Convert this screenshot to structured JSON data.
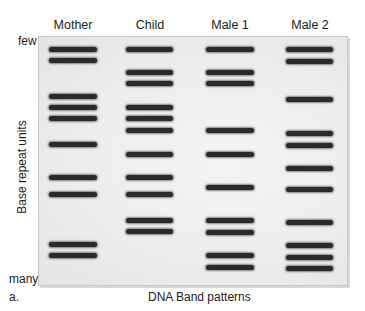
{
  "figure": {
    "panel_label": "a.",
    "x_axis_title": "DNA Band patterns",
    "y_axis_title": "Base repeat units",
    "y_axis_top": "few",
    "y_axis_bottom": "many"
  },
  "lanes": [
    {
      "label": "Mother",
      "x": 49,
      "width": 48,
      "bands_y": [
        49,
        60,
        96,
        107,
        118,
        144,
        177,
        194,
        244,
        255
      ]
    },
    {
      "label": "Child",
      "x": 126,
      "width": 47,
      "bands_y": [
        49,
        72,
        83,
        107,
        118,
        130,
        154,
        177,
        194,
        220,
        231
      ]
    },
    {
      "label": "Male 1",
      "x": 206,
      "width": 48,
      "bands_y": [
        49,
        72,
        83,
        130,
        154,
        187,
        220,
        232,
        255,
        267
      ]
    },
    {
      "label": "Male 2",
      "x": 286,
      "width": 47,
      "bands_y": [
        49,
        61,
        99,
        133,
        145,
        168,
        189,
        222,
        245,
        257,
        268
      ]
    }
  ],
  "colors": {
    "band": "#2a2a2a",
    "gel": "#ececec",
    "border": "#c8c8c8"
  }
}
